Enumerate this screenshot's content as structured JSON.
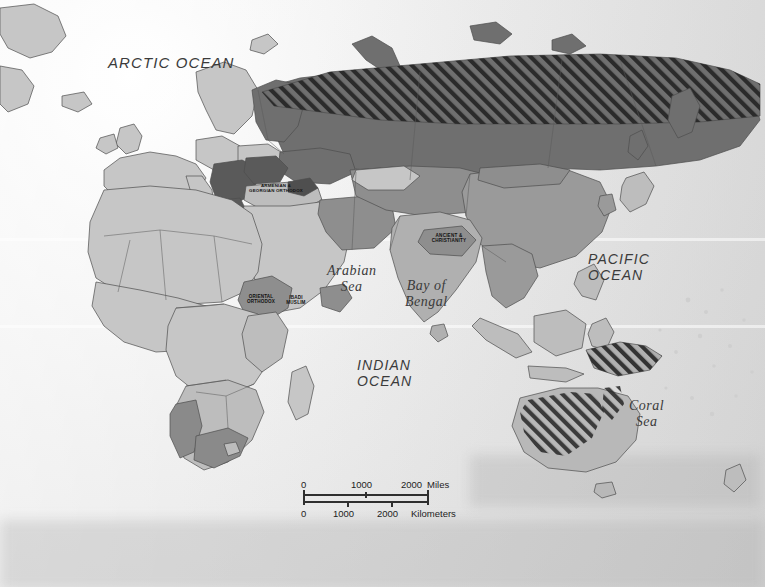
{
  "map": {
    "title": "World religions distribution map (Eastern Hemisphere)",
    "projection_area": "Europe, Africa, Asia, Australia and Oceania",
    "background_color": "#e9e9e9",
    "colors": {
      "land_light": "#c9c9c9",
      "land_medium": "#a8a8a8",
      "land_dark": "#6f6f6f",
      "land_darker": "#5e5e5e",
      "hatch_stroke": "#2b2b2b",
      "border": "#4a4a4a",
      "ocean_light": "#f2f2f2",
      "ocean_shade": "#d8d8d8",
      "text": "#333333"
    }
  },
  "ocean_labels": [
    {
      "id": "arctic-ocean",
      "text": "ARCTIC OCEAN",
      "style": "caps",
      "x": 108,
      "y": 55,
      "size": 15
    },
    {
      "id": "pacific-ocean",
      "text": "PACIFIC\nOCEAN",
      "style": "caps",
      "x": 588,
      "y": 252,
      "size": 14
    },
    {
      "id": "indian-ocean",
      "text": "INDIAN\nOCEAN",
      "style": "caps",
      "x": 357,
      "y": 358,
      "size": 14
    },
    {
      "id": "arabian-sea",
      "text": "Arabian\nSea",
      "style": "serif",
      "x": 327,
      "y": 263,
      "size": 14
    },
    {
      "id": "bay-of-bengal",
      "text": "Bay of\nBengal",
      "style": "serif",
      "x": 405,
      "y": 278,
      "size": 14
    },
    {
      "id": "coral-sea",
      "text": "Coral\nSea",
      "style": "serif",
      "x": 629,
      "y": 398,
      "size": 14
    }
  ],
  "region_labels": [
    {
      "id": "armenian-georgian-orthodox",
      "text": "ARMENIAN &\nGEORGIAN ORTHODOX",
      "x": 275,
      "y": 191,
      "size": 4.4
    },
    {
      "id": "oriental-orthodox",
      "text": "ORIENTAL\nORTHODOX",
      "x": 261,
      "y": 301,
      "size": 4.6
    },
    {
      "id": "ibadi-muslim",
      "text": "IBADI\nMUSLIM",
      "x": 295,
      "y": 303,
      "size": 4.6
    },
    {
      "id": "ancient-christianity",
      "text": "ANCIENT &\nCHRISTIANITY",
      "x": 448,
      "y": 240,
      "size": 4.6
    }
  ],
  "scale_bar": {
    "miles": {
      "unit": "Miles",
      "ticks": [
        "0",
        "1000",
        "2000"
      ]
    },
    "kilometers": {
      "unit": "Kilometers",
      "ticks": [
        "0",
        "1000",
        "2000"
      ]
    }
  }
}
